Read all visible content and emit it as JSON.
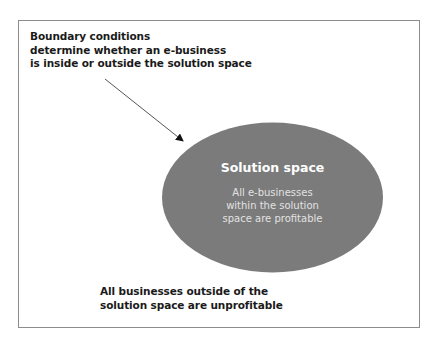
{
  "diagram": {
    "top_note": {
      "lines": [
        "Boundary conditions",
        "determine whether an e-business",
        "is inside or outside the solution space"
      ]
    },
    "solution_space": {
      "title": "Solution space",
      "lines": [
        "All e-businesses",
        "within the solution",
        "space are profitable"
      ],
      "fill_color": "#7b7b7b"
    },
    "bottom_note": {
      "lines": [
        "All businesses outside of the",
        "solution space are unprofitable"
      ]
    },
    "colors": {
      "frame": "#8c8c8c",
      "text": "#1a1a1a",
      "arrow": "#555555"
    }
  }
}
